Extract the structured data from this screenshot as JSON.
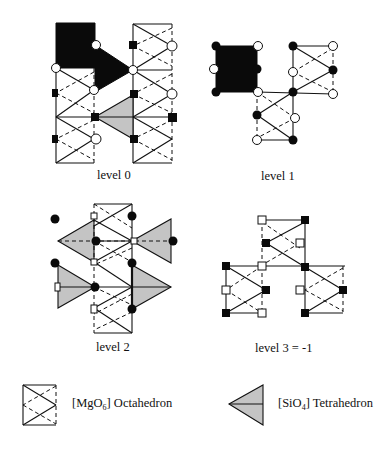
{
  "figure": {
    "panels": [
      {
        "id": "level0",
        "label": "level 0"
      },
      {
        "id": "level1",
        "label": "level 1"
      },
      {
        "id": "level2",
        "label": "level 2"
      },
      {
        "id": "level3",
        "label": "level 3 = -1"
      }
    ],
    "legend": {
      "octahedron": {
        "prefix": "[MgO",
        "subscript": "6",
        "suffix": "] Octahedron"
      },
      "tetrahedron": {
        "prefix": "[SiO",
        "subscript": "4",
        "suffix": "] Tetrahedron"
      }
    },
    "colors": {
      "line": "#111111",
      "tetrahedron_fill": "#c4c4c4",
      "filled_block": "#0a0a0a",
      "background": "#ffffff"
    },
    "symbols": {
      "open_circle": "open-circle-atom",
      "filled_circle": "filled-circle-atom",
      "open_square": "open-square-atom",
      "filled_square": "filled-square-atom"
    }
  }
}
